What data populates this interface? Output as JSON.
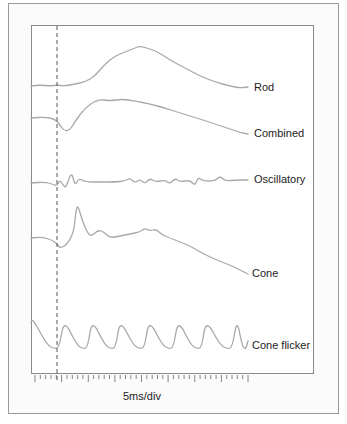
{
  "chart_data": {
    "type": "line",
    "title": "",
    "xlabel": "5ms/div",
    "ylabel": "",
    "grid": false,
    "legend_position": "inline-right",
    "stimulus_marker": {
      "style": "dashed",
      "x_px": 57
    },
    "series": [
      {
        "name": "Rod",
        "label_y": 88,
        "points": [
          [
            31,
            86
          ],
          [
            40,
            85
          ],
          [
            50,
            86
          ],
          [
            57,
            85
          ],
          [
            65,
            86
          ],
          [
            75,
            84
          ],
          [
            85,
            82
          ],
          [
            95,
            76
          ],
          [
            105,
            64
          ],
          [
            115,
            56
          ],
          [
            125,
            52
          ],
          [
            135,
            48
          ],
          [
            140,
            46
          ],
          [
            150,
            49
          ],
          [
            158,
            52
          ],
          [
            170,
            60
          ],
          [
            185,
            68
          ],
          [
            200,
            76
          ],
          [
            215,
            82
          ],
          [
            230,
            86
          ],
          [
            240,
            88
          ],
          [
            248,
            87
          ]
        ]
      },
      {
        "name": "Combined",
        "label_y": 134,
        "points": [
          [
            31,
            118
          ],
          [
            45,
            117
          ],
          [
            55,
            119
          ],
          [
            60,
            125
          ],
          [
            64,
            131
          ],
          [
            70,
            130
          ],
          [
            76,
            120
          ],
          [
            85,
            108
          ],
          [
            98,
            99
          ],
          [
            110,
            101
          ],
          [
            122,
            99
          ],
          [
            135,
            101
          ],
          [
            150,
            104
          ],
          [
            165,
            108
          ],
          [
            180,
            113
          ],
          [
            200,
            119
          ],
          [
            215,
            124
          ],
          [
            230,
            129
          ],
          [
            242,
            133
          ],
          [
            248,
            134
          ]
        ]
      },
      {
        "name": "Oscillatory",
        "label_y": 180,
        "points": [
          [
            31,
            183
          ],
          [
            45,
            182
          ],
          [
            52,
            184
          ],
          [
            57,
            186
          ],
          [
            60,
            180
          ],
          [
            63,
            185
          ],
          [
            66,
            188
          ],
          [
            69,
            178
          ],
          [
            72,
            173
          ],
          [
            75,
            186
          ],
          [
            79,
            178
          ],
          [
            85,
            182
          ],
          [
            100,
            182
          ],
          [
            115,
            182
          ],
          [
            125,
            181
          ],
          [
            130,
            178
          ],
          [
            135,
            183
          ],
          [
            140,
            179
          ],
          [
            145,
            184
          ],
          [
            150,
            178
          ],
          [
            155,
            182
          ],
          [
            165,
            180
          ],
          [
            170,
            184
          ],
          [
            175,
            178
          ],
          [
            180,
            182
          ],
          [
            190,
            180
          ],
          [
            195,
            186
          ],
          [
            198,
            177
          ],
          [
            203,
            181
          ],
          [
            215,
            181
          ],
          [
            220,
            176
          ],
          [
            225,
            181
          ],
          [
            235,
            180
          ],
          [
            248,
            180
          ]
        ]
      },
      {
        "name": "Cone",
        "label_y": 274,
        "points": [
          [
            31,
            238
          ],
          [
            42,
            237
          ],
          [
            52,
            240
          ],
          [
            57,
            244
          ],
          [
            60,
            248
          ],
          [
            65,
            246
          ],
          [
            70,
            240
          ],
          [
            74,
            230
          ],
          [
            76,
            210
          ],
          [
            78,
            205
          ],
          [
            82,
            220
          ],
          [
            88,
            234
          ],
          [
            92,
            236
          ],
          [
            98,
            230
          ],
          [
            104,
            232
          ],
          [
            110,
            238
          ],
          [
            120,
            236
          ],
          [
            130,
            234
          ],
          [
            140,
            232
          ],
          [
            145,
            228
          ],
          [
            150,
            231
          ],
          [
            156,
            229
          ],
          [
            162,
            235
          ],
          [
            170,
            238
          ],
          [
            180,
            242
          ],
          [
            190,
            246
          ],
          [
            200,
            252
          ],
          [
            212,
            258
          ],
          [
            222,
            262
          ],
          [
            232,
            266
          ],
          [
            240,
            270
          ],
          [
            248,
            274
          ]
        ]
      },
      {
        "name": "Cone flicker",
        "label_y": 346,
        "peaks_x": [
          33,
          64,
          92,
          120,
          149,
          178,
          206,
          237
        ],
        "peak_y": 319,
        "trough_y": 349,
        "points": []
      }
    ],
    "x_axis": {
      "minor_tick_count": 40,
      "major_every": 5,
      "range_px": [
        35,
        248
      ],
      "tick_y_px": 375
    }
  },
  "labels": {
    "rod": "Rod",
    "combined": "Combined",
    "oscillatory": "Oscillatory",
    "cone": "Cone",
    "cone_flicker": "Cone flicker",
    "x_axis": "5ms/div"
  },
  "colors": {
    "trace": "#a9a9a9",
    "frame": "#8a8a8a",
    "marker": "#555555",
    "text": "#222222"
  }
}
